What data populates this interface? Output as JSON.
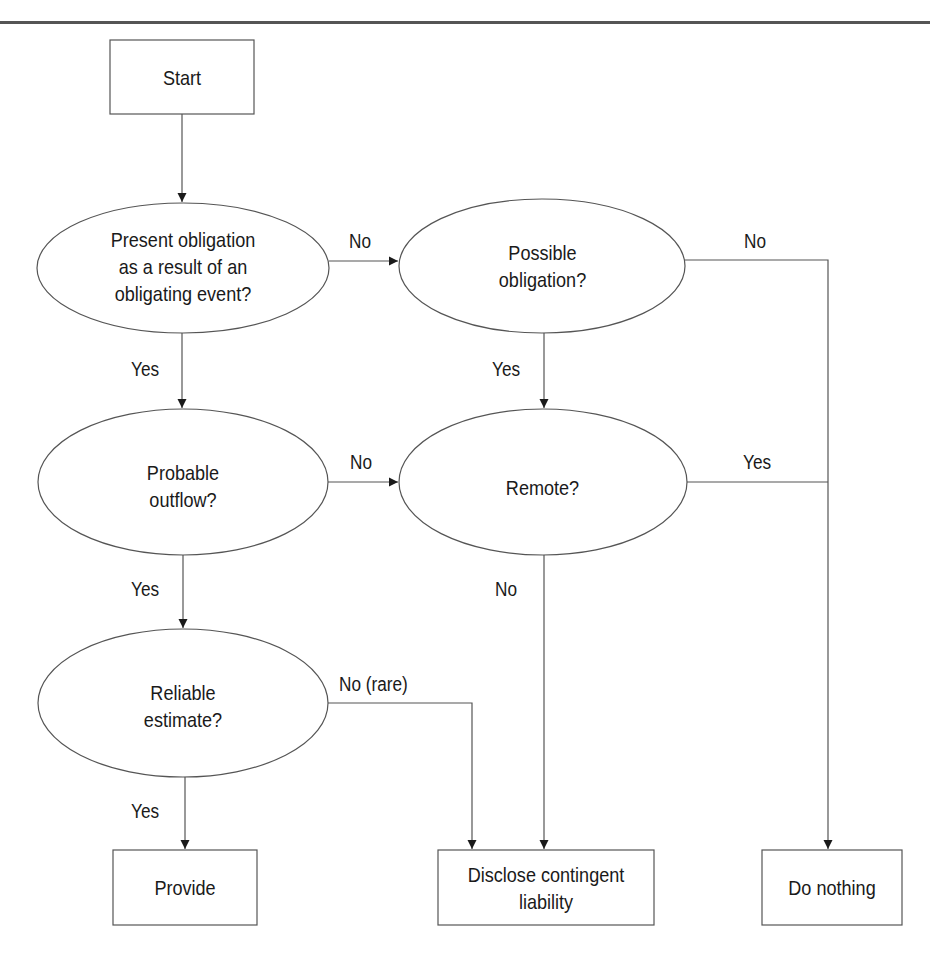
{
  "diagram": {
    "type": "flowchart",
    "nodes": {
      "start": {
        "label": "Start",
        "shape": "rectangle"
      },
      "present_obligation": {
        "label": "Present obligation as a result of an obligating event?",
        "lines": [
          "Present obligation",
          "as a result of an",
          "obligating event?"
        ],
        "shape": "ellipse"
      },
      "possible_obligation": {
        "label": "Possible obligation?",
        "lines": [
          "Possible",
          "obligation?"
        ],
        "shape": "ellipse"
      },
      "probable_outflow": {
        "label": "Probable outflow?",
        "lines": [
          "Probable",
          "outflow?"
        ],
        "shape": "ellipse"
      },
      "remote": {
        "label": "Remote?",
        "lines": [
          "Remote?"
        ],
        "shape": "ellipse"
      },
      "reliable_estimate": {
        "label": "Reliable estimate?",
        "lines": [
          "Reliable",
          "estimate?"
        ],
        "shape": "ellipse"
      },
      "provide": {
        "label": "Provide",
        "shape": "rectangle"
      },
      "disclose": {
        "label": "Disclose contingent liability",
        "lines": [
          "Disclose contingent",
          "liability"
        ],
        "shape": "rectangle"
      },
      "do_nothing": {
        "label": "Do nothing",
        "shape": "rectangle"
      }
    },
    "edges": [
      {
        "from": "start",
        "to": "present_obligation",
        "label": ""
      },
      {
        "from": "present_obligation",
        "to": "possible_obligation",
        "label": "No"
      },
      {
        "from": "possible_obligation",
        "to": "do_nothing",
        "label": "No"
      },
      {
        "from": "present_obligation",
        "to": "probable_outflow",
        "label": "Yes"
      },
      {
        "from": "possible_obligation",
        "to": "remote",
        "label": "Yes"
      },
      {
        "from": "probable_outflow",
        "to": "remote",
        "label": "No"
      },
      {
        "from": "remote",
        "to": "do_nothing",
        "label": "Yes"
      },
      {
        "from": "probable_outflow",
        "to": "reliable_estimate",
        "label": "Yes"
      },
      {
        "from": "remote",
        "to": "disclose",
        "label": "No"
      },
      {
        "from": "reliable_estimate",
        "to": "disclose",
        "label": "No (rare)"
      },
      {
        "from": "reliable_estimate",
        "to": "provide",
        "label": "Yes"
      }
    ],
    "edge_labels": {
      "present_no": "No",
      "possible_no": "No",
      "present_yes": "Yes",
      "possible_yes": "Yes",
      "probable_no": "No",
      "remote_yes": "Yes",
      "probable_yes": "Yes",
      "remote_no": "No",
      "reliable_no": "No (rare)",
      "reliable_yes": "Yes"
    },
    "colors": {
      "stroke": "#555555",
      "text": "#1a1a1a",
      "background": "#ffffff",
      "rule": "#555555"
    }
  }
}
